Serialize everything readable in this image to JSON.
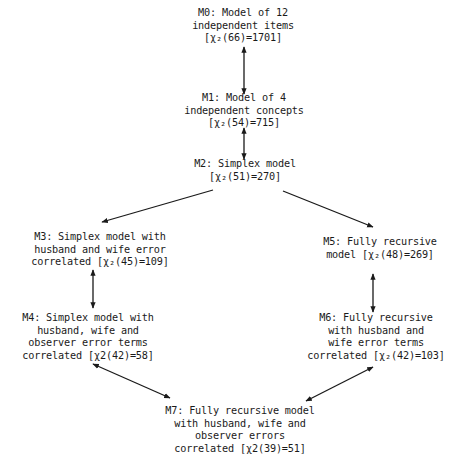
{
  "diagram": {
    "type": "model-comparison-flow",
    "nodes": [
      {
        "id": "M0",
        "lines": [
          "M0: Model of 12",
          "independent items",
          "[χ₂(66)=1701]"
        ]
      },
      {
        "id": "M1",
        "lines": [
          "M1:  Model of 4",
          "independent concepts",
          "[χ₂(54)=715]"
        ]
      },
      {
        "id": "M2",
        "lines": [
          "M2:  Simplex model",
          "[χ₂(51)=270]"
        ]
      },
      {
        "id": "M3",
        "lines": [
          "M3:  Simplex model with",
          "husband and wife error",
          "correlated [χ₂(45)=109]"
        ]
      },
      {
        "id": "M4",
        "lines": [
          "M4:  Simplex model with",
          "husband, wife and",
          "observer error terms",
          "correlated [χ2(42)=58]"
        ]
      },
      {
        "id": "M5",
        "lines": [
          "M5:  Fully recursive",
          "model [χ₂(48)=269]"
        ]
      },
      {
        "id": "M6",
        "lines": [
          "M6:  Fully recursive",
          "with husband and",
          "wife error terms",
          "correlated [χ₂(42)=103]"
        ]
      },
      {
        "id": "M7",
        "lines": [
          "M7:  Fully recursive model",
          "with husband, wife and",
          "observer errors",
          "correlated [χ2(39)=51]"
        ]
      }
    ],
    "edges": [
      {
        "from": "M0",
        "to": "M1",
        "direction": "both"
      },
      {
        "from": "M1",
        "to": "M2",
        "direction": "both"
      },
      {
        "from": "M2",
        "to": "M3",
        "direction": "forward"
      },
      {
        "from": "M2",
        "to": "M5",
        "direction": "forward"
      },
      {
        "from": "M3",
        "to": "M4",
        "direction": "both"
      },
      {
        "from": "M5",
        "to": "M6",
        "direction": "both"
      },
      {
        "from": "M4",
        "to": "M7",
        "direction": "both"
      },
      {
        "from": "M6",
        "to": "M7",
        "direction": "both"
      }
    ]
  }
}
